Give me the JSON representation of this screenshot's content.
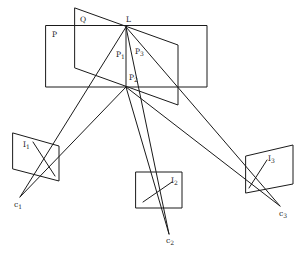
{
  "figure": {
    "labels": {
      "plane_P": "P",
      "plane_Q": "Q",
      "line_L": "L",
      "p1": {
        "base": "P",
        "sub": "1"
      },
      "p2": {
        "base": "P",
        "sub": "2"
      },
      "p3": {
        "base": "P",
        "sub": "3"
      },
      "i1": {
        "base": "I",
        "sub": "1"
      },
      "i2": {
        "base": "I",
        "sub": "2"
      },
      "i3": {
        "base": "I",
        "sub": "3"
      },
      "c1": {
        "base": "c",
        "sub": "1"
      },
      "c2": {
        "base": "c",
        "sub": "2"
      },
      "c3": {
        "base": "c",
        "sub": "3"
      }
    },
    "colors": {
      "stroke": "#1a1a1a",
      "background": "#ffffff"
    }
  }
}
